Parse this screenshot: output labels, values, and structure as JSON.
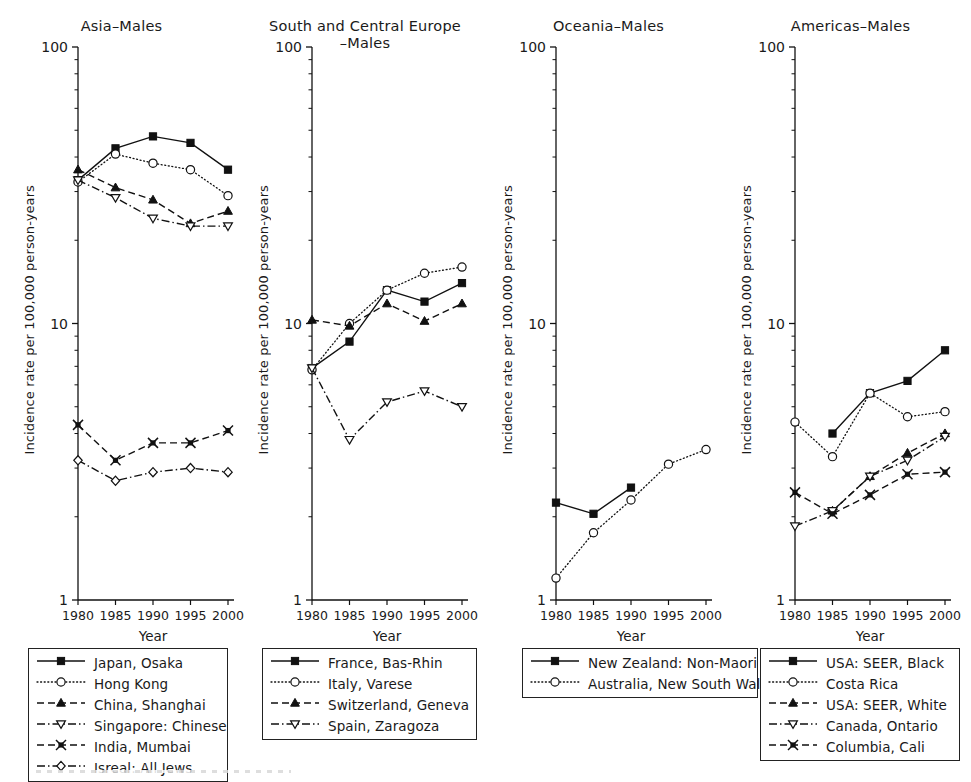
{
  "figure": {
    "axis": {
      "y_label": "Incidence rate per 100,000 person-years",
      "x_label": "Year",
      "y_ticks": [
        "100",
        "10",
        "1"
      ],
      "y_tick_values": [
        100,
        10,
        1
      ],
      "x_ticks": [
        "1980",
        "1985",
        "1990",
        "1995",
        "2000"
      ],
      "x_tick_values": [
        1980,
        1985,
        1990,
        1995,
        2000
      ],
      "scale": "log"
    },
    "panels": [
      {
        "title_line1": "Asia–Males",
        "title_line2": "",
        "legend": [
          {
            "label": "Japan, Osaka",
            "style": "solid",
            "marker": "filled-square"
          },
          {
            "label": "Hong Kong",
            "style": "dotted",
            "marker": "open-circle"
          },
          {
            "label": "China, Shanghai",
            "style": "dashed",
            "marker": "filled-triangle"
          },
          {
            "label": "Singapore: Chinese",
            "style": "dashdot",
            "marker": "open-down-triangle"
          },
          {
            "label": "India, Mumbai",
            "style": "dashed",
            "marker": "cross-x"
          },
          {
            "label": "Isreal: All Jews",
            "style": "dashdot",
            "marker": "open-diamond"
          }
        ]
      },
      {
        "title_line1": "South and Central Europe",
        "title_line2": "–Males",
        "legend": [
          {
            "label": "France, Bas-Rhin",
            "style": "solid",
            "marker": "filled-square"
          },
          {
            "label": "Italy, Varese",
            "style": "dotted",
            "marker": "open-circle"
          },
          {
            "label": "Switzerland, Geneva",
            "style": "dashed",
            "marker": "filled-triangle"
          },
          {
            "label": "Spain, Zaragoza",
            "style": "dashdot",
            "marker": "open-down-triangle"
          }
        ]
      },
      {
        "title_line1": "Oceania–Males",
        "title_line2": "",
        "legend": [
          {
            "label": "New Zealand: Non-Maori",
            "style": "solid",
            "marker": "filled-square"
          },
          {
            "label": "Australia, New South Wales",
            "style": "dotted",
            "marker": "open-circle"
          }
        ]
      },
      {
        "title_line1": "Americas–Males",
        "title_line2": "",
        "legend": [
          {
            "label": "USA: SEER, Black",
            "style": "solid",
            "marker": "filled-square"
          },
          {
            "label": "Costa Rica",
            "style": "dotted",
            "marker": "open-circle"
          },
          {
            "label": "USA: SEER, White",
            "style": "dashed",
            "marker": "filled-triangle"
          },
          {
            "label": "Canada, Ontario",
            "style": "dashdot",
            "marker": "open-down-triangle"
          },
          {
            "label": "Columbia, Cali",
            "style": "dashed",
            "marker": "cross-x"
          }
        ]
      }
    ]
  },
  "chart_data": [
    {
      "type": "line",
      "title": "Asia–Males",
      "xlabel": "Year",
      "ylabel": "Incidence rate per 100,000 person-years",
      "yscale": "log",
      "ylim": [
        1,
        100
      ],
      "x": [
        1980,
        1985,
        1990,
        1995,
        2000
      ],
      "series": [
        {
          "name": "Japan, Osaka",
          "values": [
            33.0,
            43.0,
            47.5,
            45.0,
            36.0
          ],
          "marker": "filled-square",
          "style": "solid"
        },
        {
          "name": "Hong Kong",
          "values": [
            32.5,
            41.0,
            38.0,
            36.0,
            29.0
          ],
          "marker": "open-circle",
          "style": "dotted"
        },
        {
          "name": "China, Shanghai",
          "values": [
            36.0,
            31.0,
            28.0,
            23.0,
            25.5
          ],
          "marker": "filled-triangle",
          "style": "dashed"
        },
        {
          "name": "Singapore: Chinese",
          "values": [
            33.0,
            28.5,
            24.0,
            22.5,
            22.5
          ],
          "marker": "open-down-triangle",
          "style": "dashdot"
        },
        {
          "name": "India, Mumbai",
          "values": [
            4.3,
            3.2,
            3.7,
            3.7,
            4.1
          ],
          "marker": "cross-x",
          "style": "dashed"
        },
        {
          "name": "Isreal: All Jews",
          "values": [
            3.2,
            2.7,
            2.9,
            3.0,
            2.9
          ],
          "marker": "open-diamond",
          "style": "dashdot"
        }
      ]
    },
    {
      "type": "line",
      "title": "South and Central Europe–Males",
      "xlabel": "Year",
      "ylabel": "Incidence rate per 100,000 person-years",
      "yscale": "log",
      "ylim": [
        1,
        100
      ],
      "x": [
        1980,
        1985,
        1990,
        1995,
        2000
      ],
      "series": [
        {
          "name": "France, Bas-Rhin",
          "values": [
            6.9,
            8.6,
            13.2,
            12.0,
            14.0
          ],
          "marker": "filled-square",
          "style": "solid"
        },
        {
          "name": "Italy, Varese",
          "values": [
            6.8,
            10.0,
            13.2,
            15.2,
            16.0
          ],
          "marker": "open-circle",
          "style": "dotted"
        },
        {
          "name": "Switzerland, Geneva",
          "values": [
            10.3,
            9.8,
            11.8,
            10.2,
            11.8
          ],
          "marker": "filled-triangle",
          "style": "dashed"
        },
        {
          "name": "Spain, Zaragoza",
          "values": [
            6.9,
            3.8,
            5.2,
            5.7,
            5.0
          ],
          "marker": "open-down-triangle",
          "style": "dashdot"
        }
      ]
    },
    {
      "type": "line",
      "title": "Oceania–Males",
      "xlabel": "Year",
      "ylabel": "Incidence rate per 100,000 person-years",
      "yscale": "log",
      "ylim": [
        1,
        100
      ],
      "x": [
        1980,
        1985,
        1990,
        1995,
        2000
      ],
      "series": [
        {
          "name": "New Zealand: Non-Maori",
          "values": [
            2.25,
            2.05,
            2.55,
            null,
            null
          ],
          "marker": "filled-square",
          "style": "solid"
        },
        {
          "name": "Australia, New South Wales",
          "values": [
            1.2,
            1.75,
            2.3,
            3.1,
            3.5
          ],
          "marker": "open-circle",
          "style": "dotted"
        }
      ]
    },
    {
      "type": "line",
      "title": "Americas–Males",
      "xlabel": "Year",
      "ylabel": "Incidence rate per 100,000 person-years",
      "yscale": "log",
      "ylim": [
        1,
        100
      ],
      "x": [
        1980,
        1985,
        1990,
        1995,
        2000
      ],
      "series": [
        {
          "name": "USA: SEER, Black",
          "values": [
            null,
            4.0,
            5.6,
            6.2,
            8.0
          ],
          "marker": "filled-square",
          "style": "solid"
        },
        {
          "name": "Costa Rica",
          "values": [
            4.4,
            3.3,
            5.6,
            4.6,
            4.8
          ],
          "marker": "open-circle",
          "style": "dotted"
        },
        {
          "name": "USA: SEER, White",
          "values": [
            null,
            2.1,
            2.8,
            3.4,
            4.0
          ],
          "marker": "filled-triangle",
          "style": "dashed"
        },
        {
          "name": "Canada, Ontario",
          "values": [
            1.85,
            2.1,
            2.8,
            3.2,
            3.9
          ],
          "marker": "open-down-triangle",
          "style": "dashdot"
        },
        {
          "name": "Columbia, Cali",
          "values": [
            2.45,
            2.05,
            2.4,
            2.85,
            2.9
          ],
          "marker": "cross-x",
          "style": "dashed"
        }
      ]
    }
  ]
}
